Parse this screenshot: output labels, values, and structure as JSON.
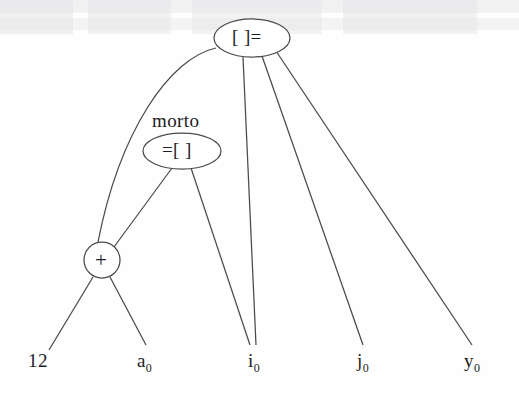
{
  "diagram": {
    "type": "expression-dag",
    "title": "",
    "stroke_color": "#4a4a4a",
    "text_color": "#1d1d1d",
    "background_color": "#fefefe",
    "nodes": [
      {
        "id": "root",
        "shape": "ellipse",
        "label": "[ ]=",
        "tag": "",
        "cx": 252,
        "cy": 38,
        "rx": 38,
        "ry": 19
      },
      {
        "id": "assign",
        "shape": "ellipse",
        "label": "=[ ]",
        "tag": "morto",
        "cx": 182,
        "cy": 151,
        "rx": 39,
        "ry": 18
      },
      {
        "id": "plus",
        "shape": "circle",
        "label": "+",
        "tag": "",
        "cx": 102,
        "cy": 260,
        "rx": 18,
        "ry": 18
      }
    ],
    "leaves": [
      {
        "id": "l1",
        "label": "12",
        "base": "12",
        "sub": "",
        "x": 28,
        "y": 368
      },
      {
        "id": "l2",
        "label": "a0",
        "base": "a",
        "sub": "0",
        "x": 137,
        "y": 368
      },
      {
        "id": "l3",
        "label": "i0",
        "base": "i",
        "sub": "0",
        "x": 248,
        "y": 368
      },
      {
        "id": "l4",
        "label": "j0",
        "base": "j",
        "sub": "0",
        "x": 357,
        "y": 368
      },
      {
        "id": "l5",
        "label": "y0",
        "base": "y",
        "sub": "0",
        "x": 464,
        "y": 368
      }
    ],
    "edges": [
      {
        "from": "root",
        "to": "plus",
        "style": "curved"
      },
      {
        "from": "root",
        "to": "l3",
        "style": "straight"
      },
      {
        "from": "root",
        "to": "l4",
        "style": "straight"
      },
      {
        "from": "root",
        "to": "l5",
        "style": "straight"
      },
      {
        "from": "assign",
        "to": "plus",
        "style": "straight"
      },
      {
        "from": "assign",
        "to": "l3",
        "style": "straight"
      },
      {
        "from": "plus",
        "to": "l1",
        "style": "straight"
      },
      {
        "from": "plus",
        "to": "l2",
        "style": "straight"
      }
    ]
  }
}
